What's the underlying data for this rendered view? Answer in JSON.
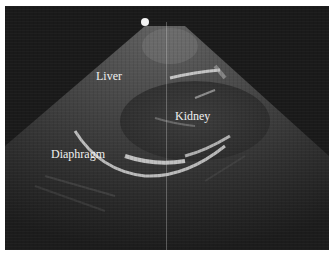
{
  "image": {
    "type": "ultrasound",
    "labels": {
      "liver": "Liver",
      "kidney": "Kidney",
      "diaphragm": "Diaphragm"
    },
    "colors": {
      "background": "#1a1a1a",
      "label_text": "#f0f0f0",
      "border": "#ffffff"
    }
  }
}
